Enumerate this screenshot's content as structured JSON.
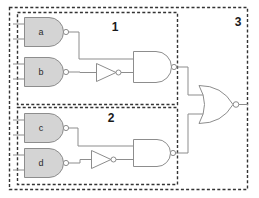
{
  "diagram": {
    "background_color": "#ffffff",
    "wire_color": "#8d8d8d",
    "gate_fill_color": "#d4d4d4",
    "dashed_border_color": "#333333",
    "blocks": [
      {
        "id": "block-1",
        "label": "1",
        "label_x": 115,
        "label_y": 31,
        "x": 17,
        "y": 12,
        "w": 161,
        "h": 93
      },
      {
        "id": "block-2",
        "label": "2",
        "label_x": 111,
        "label_y": 122,
        "x": 17,
        "y": 107,
        "w": 161,
        "h": 78
      },
      {
        "id": "block-3",
        "label": "3",
        "label_x": 238,
        "label_y": 26,
        "x": 9,
        "y": 7,
        "w": 239,
        "h": 183
      }
    ],
    "gates": [
      {
        "id": "gate-a",
        "label": "a",
        "type": "nand",
        "filled": true,
        "x": 24,
        "y": 17,
        "w": 40,
        "h": 29
      },
      {
        "id": "gate-b",
        "label": "b",
        "type": "nand",
        "filled": true,
        "x": 24,
        "y": 57,
        "w": 40,
        "h": 29
      },
      {
        "id": "gate-c",
        "label": "c",
        "type": "nand",
        "filled": true,
        "x": 24,
        "y": 113,
        "w": 40,
        "h": 29
      },
      {
        "id": "gate-d",
        "label": "d",
        "type": "nand",
        "filled": true,
        "x": 24,
        "y": 148,
        "w": 40,
        "h": 29
      },
      {
        "id": "inverter-1",
        "label": "",
        "type": "inverter",
        "filled": false,
        "x": 96,
        "y": 63,
        "w": 23,
        "h": 19
      },
      {
        "id": "inverter-2",
        "label": "",
        "type": "inverter",
        "filled": false,
        "x": 91,
        "y": 150,
        "w": 23,
        "h": 19
      },
      {
        "id": "nand-1",
        "label": "",
        "type": "nand",
        "filled": false,
        "x": 133,
        "y": 51,
        "w": 39,
        "h": 31
      },
      {
        "id": "nand-2",
        "label": "",
        "type": "nand",
        "filled": false,
        "x": 133,
        "y": 139,
        "w": 39,
        "h": 27
      },
      {
        "id": "nor-out",
        "label": "",
        "type": "nor",
        "filled": false,
        "x": 198,
        "y": 85,
        "w": 37,
        "h": 39
      }
    ],
    "input_stub_count": 8,
    "output_label": ""
  }
}
